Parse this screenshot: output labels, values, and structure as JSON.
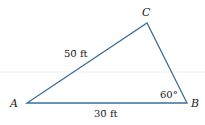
{
  "diagram": {
    "type": "triangle",
    "vertices": {
      "A": {
        "label": "A"
      },
      "B": {
        "label": "B"
      },
      "C": {
        "label": "C"
      }
    },
    "sides": {
      "AC": {
        "label": "50̄ ft"
      },
      "AB": {
        "label": "30̄ ft"
      }
    },
    "angles": {
      "B": {
        "label": "60°"
      }
    },
    "colors": {
      "line": "#3a6f99",
      "text": "#222222",
      "guide": "#eeeeee"
    }
  }
}
